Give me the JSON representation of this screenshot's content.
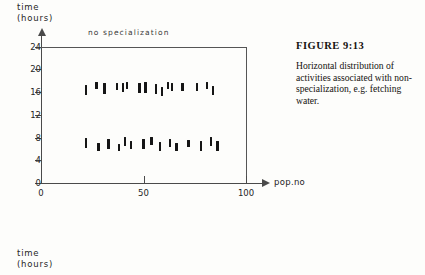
{
  "figure": {
    "caption_title": "FIGURE 9:13",
    "caption_body": "Horizontal distribution of activities associated with non-specialization, e.g. fetching water."
  },
  "chart_top": {
    "y_axis_title_line1": "time",
    "y_axis_title_line2": "(hours)",
    "series_label": "no  specialization",
    "x_axis_name": "pop.no"
  },
  "chart_bottom": {
    "y_axis_title_line1": "time",
    "y_axis_title_line2": "(hours)"
  },
  "colors": {
    "mark": "#151515",
    "axis": "#4a4a4a",
    "frame": "#555555",
    "paper": "#fdfdfb"
  },
  "chart_data": {
    "type": "scatter",
    "title": "no specialization",
    "xlabel": "pop.no",
    "ylabel": "time (hours)",
    "xlim": [
      0,
      100
    ],
    "ylim": [
      0,
      24
    ],
    "grid": false,
    "legend": "none",
    "x_ticks": [
      0,
      50,
      100
    ],
    "y_ticks": [
      0,
      4,
      8,
      12,
      16,
      20,
      24
    ],
    "marker_style": "short vertical bar",
    "annotations": [
      "no specialization"
    ],
    "series": [
      {
        "name": "upper band",
        "points": [
          {
            "x": 22,
            "y": 16.3,
            "extent": 1.8
          },
          {
            "x": 27,
            "y": 17.1,
            "extent": 1.2
          },
          {
            "x": 31,
            "y": 16.6,
            "extent": 1.8
          },
          {
            "x": 37,
            "y": 17.0,
            "extent": 1.3
          },
          {
            "x": 40,
            "y": 16.8,
            "extent": 1.6
          },
          {
            "x": 42,
            "y": 17.1,
            "extent": 1.2
          },
          {
            "x": 48,
            "y": 16.7,
            "extent": 1.9
          },
          {
            "x": 51,
            "y": 16.8,
            "extent": 1.8
          },
          {
            "x": 56,
            "y": 16.5,
            "extent": 1.7
          },
          {
            "x": 59,
            "y": 16.1,
            "extent": 1.5
          },
          {
            "x": 62,
            "y": 17.2,
            "extent": 1.2
          },
          {
            "x": 64,
            "y": 16.9,
            "extent": 1.5
          },
          {
            "x": 69,
            "y": 16.9,
            "extent": 1.5
          },
          {
            "x": 76,
            "y": 16.9,
            "extent": 1.4
          },
          {
            "x": 81,
            "y": 17.2,
            "extent": 1.2
          },
          {
            "x": 84,
            "y": 16.2,
            "extent": 1.6
          }
        ]
      },
      {
        "name": "lower band",
        "points": [
          {
            "x": 22,
            "y": 7.0,
            "extent": 1.7
          },
          {
            "x": 28,
            "y": 6.3,
            "extent": 1.5
          },
          {
            "x": 33,
            "y": 6.9,
            "extent": 1.8
          },
          {
            "x": 38,
            "y": 6.2,
            "extent": 1.3
          },
          {
            "x": 41,
            "y": 7.3,
            "extent": 1.6
          },
          {
            "x": 44,
            "y": 6.7,
            "extent": 1.3
          },
          {
            "x": 50,
            "y": 6.9,
            "extent": 1.8
          },
          {
            "x": 54,
            "y": 7.4,
            "extent": 1.5
          },
          {
            "x": 58,
            "y": 6.4,
            "extent": 1.5
          },
          {
            "x": 63,
            "y": 7.0,
            "extent": 1.4
          },
          {
            "x": 66,
            "y": 6.3,
            "extent": 1.3
          },
          {
            "x": 72,
            "y": 6.9,
            "extent": 1.3
          },
          {
            "x": 78,
            "y": 6.5,
            "extent": 1.6
          },
          {
            "x": 83,
            "y": 7.3,
            "extent": 1.5
          },
          {
            "x": 86,
            "y": 6.5,
            "extent": 1.6
          }
        ]
      }
    ]
  }
}
